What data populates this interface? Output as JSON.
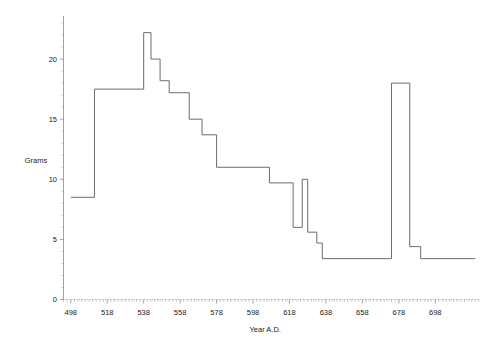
{
  "chart_data": {
    "type": "line",
    "subtype": "step",
    "title": "",
    "xlabel": "Year A.D.",
    "ylabel": "Grams",
    "xlim": [
      494,
      722
    ],
    "ylim": [
      0,
      23.5
    ],
    "grid": false,
    "legend": null,
    "x_ticks": [
      498,
      518,
      538,
      558,
      578,
      598,
      618,
      638,
      658,
      678,
      698
    ],
    "x_tick_labels": [
      "498",
      "518",
      "538",
      "558",
      "578",
      "598",
      "618",
      "638",
      "658",
      "678",
      "698"
    ],
    "x_minor_tick_step": 2,
    "y_ticks": [
      0,
      5,
      10,
      15,
      20
    ],
    "y_tick_labels": [
      "0",
      "5",
      "10",
      "15",
      "20"
    ],
    "y_minor_tick_step": 1,
    "series": [
      {
        "name": "Coin weight standard",
        "color": "#5b5b5b",
        "steps": [
          {
            "x_start": 498,
            "x_end": 511,
            "value": 8.5
          },
          {
            "x_start": 511,
            "x_end": 538,
            "value": 17.5
          },
          {
            "x_start": 538,
            "x_end": 542,
            "value": 22.2
          },
          {
            "x_start": 542,
            "x_end": 547,
            "value": 20.0
          },
          {
            "x_start": 547,
            "x_end": 552,
            "value": 18.2
          },
          {
            "x_start": 552,
            "x_end": 563,
            "value": 17.2
          },
          {
            "x_start": 563,
            "x_end": 570,
            "value": 15.0
          },
          {
            "x_start": 570,
            "x_end": 578,
            "value": 13.7
          },
          {
            "x_start": 578,
            "x_end": 607,
            "value": 11.0
          },
          {
            "x_start": 607,
            "x_end": 620,
            "value": 9.7
          },
          {
            "x_start": 620,
            "x_end": 625,
            "value": 6.0
          },
          {
            "x_start": 625,
            "x_end": 628,
            "value": 10.0
          },
          {
            "x_start": 628,
            "x_end": 633,
            "value": 5.6
          },
          {
            "x_start": 633,
            "x_end": 636,
            "value": 4.7
          },
          {
            "x_start": 636,
            "x_end": 674,
            "value": 3.4
          },
          {
            "x_start": 674,
            "x_end": 684,
            "value": 18.0
          },
          {
            "x_start": 684,
            "x_end": 690,
            "value": 4.4
          },
          {
            "x_start": 690,
            "x_end": 720,
            "value": 3.4
          }
        ]
      }
    ]
  }
}
